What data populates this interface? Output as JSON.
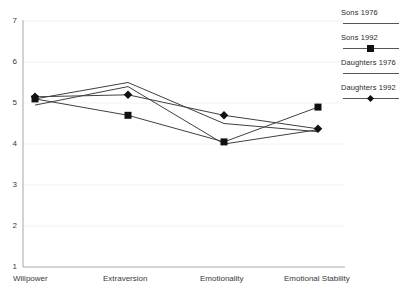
{
  "chart_data": {
    "type": "line",
    "title": "",
    "xlabel": "",
    "ylabel": "",
    "categories": [
      "Willpower",
      "Extraversion",
      "Emotionality",
      "Emotional Stability"
    ],
    "ylim": [
      1,
      7
    ],
    "yticks": [
      1,
      2,
      3,
      4,
      5,
      6,
      7
    ],
    "grid": true,
    "grid_orientation": "horizontal",
    "legend_position": "right",
    "series": [
      {
        "name": "Sons 1976",
        "marker": "none",
        "values": [
          5.1,
          5.5,
          4.5,
          4.3
        ]
      },
      {
        "name": "Sons 1992",
        "marker": "square",
        "values": [
          5.1,
          4.7,
          4.05,
          4.9
        ]
      },
      {
        "name": "Daughters 1976",
        "marker": "none",
        "values": [
          4.95,
          5.4,
          4.0,
          4.35
        ]
      },
      {
        "name": "Daughters 1992",
        "marker": "diamond",
        "values": [
          5.15,
          5.2,
          4.7,
          4.37
        ]
      }
    ],
    "colors": {
      "line": "#404040",
      "marker": "#111111",
      "axis": "#9a9a9a",
      "grid": "#f0f0f0",
      "text": "#2a2a2a"
    }
  },
  "ytick_labels": [
    "7",
    "6",
    "5",
    "4",
    "3",
    "2",
    "1"
  ],
  "xtick_labels": [
    "Willpower",
    "Extraversion",
    "Emotionality",
    "Emotional Stability"
  ],
  "legend": {
    "entries": [
      {
        "label": "Sons 1976",
        "marker": "none"
      },
      {
        "label": "Sons 1992",
        "marker": "square"
      },
      {
        "label": "Daughters 1976",
        "marker": "none"
      },
      {
        "label": "Daughters 1992",
        "marker": "diamond"
      }
    ]
  }
}
